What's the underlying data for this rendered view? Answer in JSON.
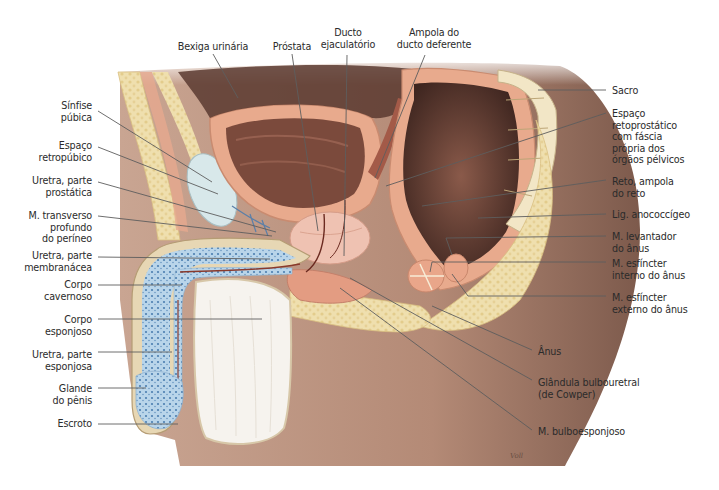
{
  "figure": {
    "signature": "Voll",
    "colors": {
      "skin": "#b58c78",
      "skin_dark": "#8a6556",
      "fat": "#ecd9a4",
      "muscle": "#e7a98c",
      "mucosa": "#7a4a3c",
      "erectile_blue": "#9fc3de",
      "cavity": "#5c3a30",
      "white": "#f7f4ee",
      "leader": "#5e5e5e"
    }
  },
  "labels": {
    "top": [
      {
        "text": "Bexiga urinária",
        "x": 168,
        "y": 41,
        "w": 90,
        "align": "c",
        "line": [
          [
            213,
            54
          ],
          [
            238,
            98
          ]
        ]
      },
      {
        "text": "Próstata",
        "x": 267,
        "y": 41,
        "w": 50,
        "align": "c",
        "line": [
          [
            292,
            54
          ],
          [
            318,
            231
          ]
        ]
      },
      {
        "text": "Ducto\nejaculatório",
        "x": 318,
        "y": 27,
        "w": 60,
        "align": "c",
        "line": [
          [
            347,
            55
          ],
          [
            344,
            256
          ]
        ]
      },
      {
        "text": "Ampola do\nducto deferente",
        "x": 392,
        "y": 27,
        "w": 84,
        "align": "c",
        "line": [
          [
            425,
            55
          ],
          [
            375,
            178
          ]
        ]
      }
    ],
    "left": [
      {
        "text": "Sínfise\npúbica",
        "x": 30,
        "y": 100,
        "w": 62,
        "line": [
          [
            98,
            111
          ],
          [
            212,
            182
          ]
        ]
      },
      {
        "text": "Espaço\nretropúbico",
        "x": 20,
        "y": 140,
        "w": 72,
        "line": [
          [
            98,
            147
          ],
          [
            218,
            194
          ]
        ]
      },
      {
        "text": "Uretra, parte\nprostática",
        "x": 20,
        "y": 175,
        "w": 72,
        "line": [
          [
            98,
            182
          ],
          [
            276,
            232
          ]
        ]
      },
      {
        "text": "M. transverso\nprofundo\ndo períneo",
        "x": 20,
        "y": 210,
        "w": 72,
        "line": [
          [
            98,
            216
          ],
          [
            272,
            236
          ]
        ]
      },
      {
        "text": "Uretra, parte\nmembranácea",
        "x": 10,
        "y": 250,
        "w": 82,
        "line": [
          [
            98,
            257
          ],
          [
            270,
            259
          ]
        ]
      },
      {
        "text": "Corpo\ncavernoso",
        "x": 20,
        "y": 279,
        "w": 72,
        "line": [
          [
            98,
            285
          ],
          [
            182,
            285
          ]
        ]
      },
      {
        "text": "Corpo\nesponjoso",
        "x": 20,
        "y": 314,
        "w": 72,
        "line": [
          [
            98,
            319
          ],
          [
            262,
            319
          ]
        ]
      },
      {
        "text": "Uretra, parte\nesponjosa",
        "x": 10,
        "y": 349,
        "w": 82,
        "line": [
          [
            98,
            352
          ],
          [
            172,
            352
          ]
        ]
      },
      {
        "text": "Glande\ndo pênis",
        "x": 20,
        "y": 383,
        "w": 72,
        "line": [
          [
            98,
            388
          ],
          [
            146,
            388
          ]
        ]
      },
      {
        "text": "Escroto",
        "x": 20,
        "y": 418,
        "w": 72,
        "line": [
          [
            98,
            424
          ],
          [
            178,
            424
          ]
        ]
      }
    ],
    "right": [
      {
        "text": "Sacro",
        "x": 612,
        "y": 85,
        "line": [
          [
            606,
            90
          ],
          [
            538,
            90
          ]
        ]
      },
      {
        "text": "Espaço\nretoprostático\ncom fáscia\nprópria dos\nórgãos pélvicos",
        "x": 612,
        "y": 108,
        "line": [
          [
            606,
            113
          ],
          [
            386,
            186
          ]
        ]
      },
      {
        "text": "Reto, ampola\ndo reto",
        "x": 612,
        "y": 176,
        "line": [
          [
            606,
            180
          ],
          [
            422,
            206
          ]
        ]
      },
      {
        "text": "Lig. anococcígeo",
        "x": 612,
        "y": 209,
        "line": [
          [
            606,
            214
          ],
          [
            478,
            218
          ]
        ]
      },
      {
        "text": "M. levantador\ndo ânus",
        "x": 612,
        "y": 231,
        "line": [
          [
            606,
            236
          ],
          [
            446,
            238
          ],
          [
            452,
            255
          ]
        ]
      },
      {
        "text": "M. esfíncter\ninterno do ânus",
        "x": 612,
        "y": 258,
        "line": [
          [
            606,
            262
          ],
          [
            432,
            262
          ],
          [
            430,
            272
          ]
        ]
      },
      {
        "text": "M. esfíncter\nexterno do ânus",
        "x": 612,
        "y": 292,
        "line": [
          [
            606,
            296
          ],
          [
            468,
            296
          ],
          [
            452,
            274
          ]
        ]
      },
      {
        "text": "Ânus",
        "x": 538,
        "y": 346,
        "line": [
          [
            532,
            350
          ],
          [
            432,
            306
          ]
        ]
      },
      {
        "text": "Glândula bulbouretral\n(de Cowper)",
        "x": 538,
        "y": 377,
        "line": [
          [
            532,
            380
          ],
          [
            350,
            278
          ]
        ]
      },
      {
        "text": "M. bulboesponjoso",
        "x": 538,
        "y": 426,
        "line": [
          [
            532,
            430
          ],
          [
            340,
            288
          ]
        ]
      }
    ]
  }
}
